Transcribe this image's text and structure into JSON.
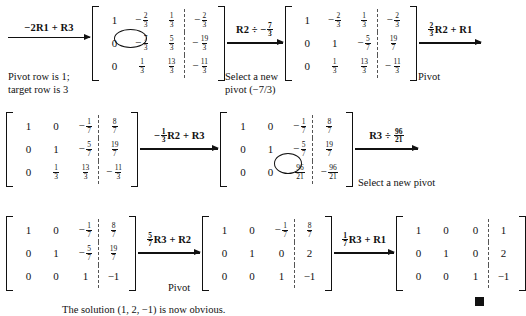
{
  "figure": {
    "conclusion": "The solution (1, 2, −1) is now obvious.",
    "qed_marker": "■"
  },
  "steps": [
    {
      "id": "step-1",
      "operation": "−2R1 + R3",
      "operation_parts": {
        "prefix": "−2R1 + R3"
      },
      "caption": "Pivot row is 1;\ntarget row is 3",
      "matrix": {
        "rows": [
          [
            "1",
            "-2/3",
            "1/3",
            "-2/3"
          ],
          [
            "0",
            "-7/3",
            "5/3",
            "-19/3"
          ],
          [
            "0",
            "1/3",
            "13/3",
            "-11/3"
          ]
        ],
        "circled_cell": [
          1,
          1
        ]
      }
    },
    {
      "id": "step-2",
      "operation": "R2 ÷ −7/3",
      "caption": "Select a new\npivot (−7/3)",
      "matrix": {
        "rows": [
          [
            "1",
            "-2/3",
            "1/3",
            "-2/3"
          ],
          [
            "0",
            "1",
            "-5/7",
            "19/7"
          ],
          [
            "0",
            "1/3",
            "13/3",
            "-11/3"
          ]
        ],
        "circled_cell": null
      }
    },
    {
      "id": "step-3",
      "operation": "2/3R2 + R1",
      "caption": "Pivot",
      "matrix": null
    },
    {
      "id": "step-4",
      "operation": "−1/3R2 + R3",
      "caption": "",
      "matrix": {
        "rows": [
          [
            "1",
            "0",
            "-1/7",
            "8/7"
          ],
          [
            "0",
            "1",
            "-5/7",
            "19/7"
          ],
          [
            "0",
            "1/3",
            "13/3",
            "-11/3"
          ]
        ],
        "circled_cell": null
      }
    },
    {
      "id": "step-5",
      "operation": "R3 ÷ 96/21",
      "caption": "Select a new pivot",
      "matrix": {
        "rows": [
          [
            "1",
            "0",
            "-1/7",
            "8/7"
          ],
          [
            "0",
            "1",
            "-5/7",
            "19/7"
          ],
          [
            "0",
            "0",
            "96/21",
            "-96/21"
          ]
        ],
        "circled_cell": [
          2,
          2
        ]
      }
    },
    {
      "id": "step-6",
      "operation": "5/7R3 + R2",
      "caption": "Pivot",
      "matrix": {
        "rows": [
          [
            "1",
            "0",
            "-1/7",
            "8/7"
          ],
          [
            "0",
            "1",
            "-5/7",
            "19/7"
          ],
          [
            "0",
            "0",
            "1",
            "-1"
          ]
        ],
        "circled_cell": null
      }
    },
    {
      "id": "step-7",
      "operation": "1/7R3 + R1",
      "caption": "",
      "matrix": {
        "rows": [
          [
            "1",
            "0",
            "-1/7",
            "8/7"
          ],
          [
            "0",
            "1",
            "0",
            "2"
          ],
          [
            "0",
            "0",
            "1",
            "-1"
          ]
        ],
        "circled_cell": null
      }
    },
    {
      "id": "step-8",
      "operation": "",
      "caption": "",
      "matrix": {
        "rows": [
          [
            "1",
            "0",
            "0",
            "1"
          ],
          [
            "0",
            "1",
            "0",
            "2"
          ],
          [
            "0",
            "0",
            "1",
            "-1"
          ]
        ],
        "circled_cell": null
      }
    }
  ],
  "labels": {
    "pivot": "Pivot",
    "select_new_pivot": "Select a new pivot",
    "pivot_row_note": "Pivot row is 1;\ntarget row is 3",
    "select_pivot_note": "Select a new\npivot (−7/3)"
  },
  "colors": {
    "ink": "#111111",
    "background": "#ffffff",
    "augment_divider": "#555555"
  }
}
